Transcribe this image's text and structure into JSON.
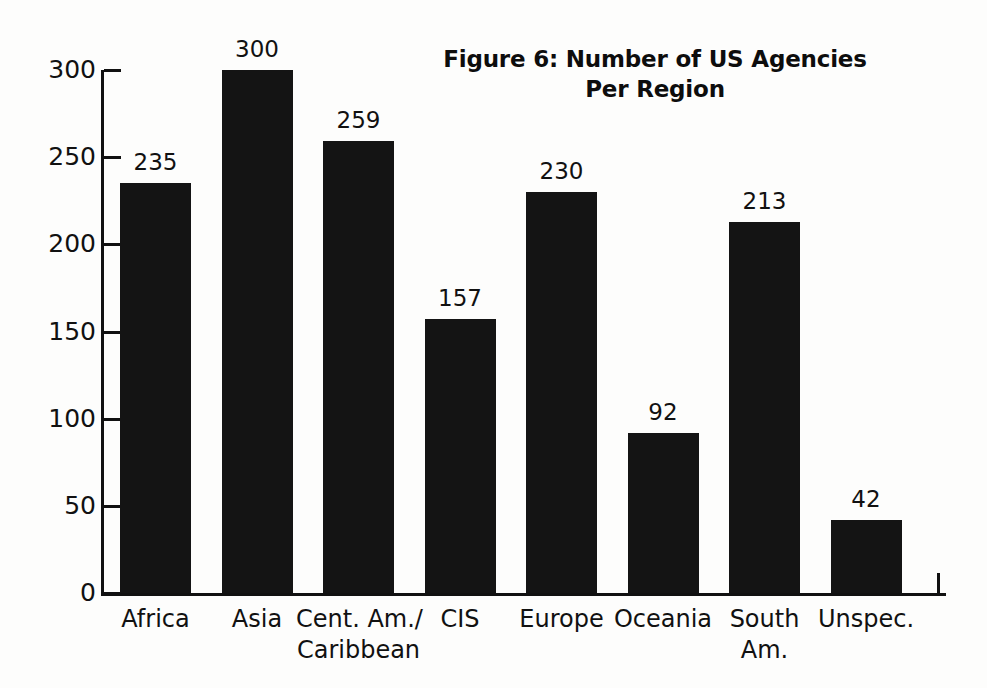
{
  "chart_data": {
    "type": "bar",
    "title": "Figure 6: Number of US Agencies Per Region",
    "title_lines": [
      "Figure 6: Number of US Agencies",
      "Per Region"
    ],
    "xlabel": "",
    "ylabel": "",
    "categories": [
      "Africa",
      "Asia",
      "Cent. Am./ Caribbean",
      "CIS",
      "Europe",
      "Oceania",
      "South Am.",
      "Unspec."
    ],
    "category_lines": [
      [
        "Africa"
      ],
      [
        "Asia"
      ],
      [
        "Cent. Am./",
        "Caribbean"
      ],
      [
        "CIS"
      ],
      [
        "Europe"
      ],
      [
        "Oceania"
      ],
      [
        "South",
        "Am."
      ],
      [
        "Unspec."
      ]
    ],
    "values": [
      235,
      300,
      259,
      157,
      230,
      92,
      213,
      42
    ],
    "value_labels": [
      "235",
      "300",
      "259",
      "157",
      "230",
      "92",
      "213",
      "42"
    ],
    "ylim": [
      0,
      300
    ],
    "yticks": [
      0,
      50,
      100,
      150,
      200,
      250,
      300
    ],
    "ytick_labels": [
      "0",
      "50",
      "100",
      "150",
      "200",
      "250",
      "300"
    ],
    "grid": false,
    "legend": false,
    "bar_color": "#141414",
    "axis_color": "#111111",
    "background_color": "#fdfdfc"
  }
}
